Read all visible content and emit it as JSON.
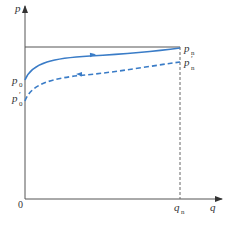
{
  "diagram": {
    "type": "p-q characteristic curve",
    "axes": {
      "x_label": "q",
      "y_label": "p",
      "origin_label": "0"
    },
    "points": {
      "pn": {
        "base": "p",
        "sub": "n",
        "prime": ""
      },
      "pn_prime": {
        "base": "p",
        "sub": "n",
        "prime": "′"
      },
      "p0": {
        "base": "p",
        "sub": "0",
        "prime": ""
      },
      "p0_prime": {
        "base": "p",
        "sub": "0",
        "prime": "′"
      },
      "qn": {
        "base": "q",
        "sub": "n"
      }
    },
    "curves": [
      {
        "name": "solid curve p0 to pn",
        "style": "solid",
        "color": "#3a7cc7",
        "arrow_direction": "right"
      },
      {
        "name": "dashed curve p0' to pn'",
        "style": "dashed",
        "color": "#3a7cc7",
        "arrow_direction": "left"
      }
    ],
    "lines": [
      {
        "name": "horizontal reference at pn",
        "style": "solid",
        "color": "#555555"
      },
      {
        "name": "vertical dashed at qn",
        "style": "dashed",
        "color": "#555555"
      }
    ]
  }
}
